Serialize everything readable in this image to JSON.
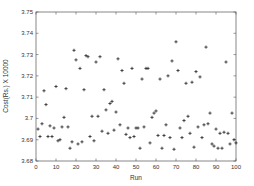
{
  "chart_data": {
    "type": "scatter",
    "title": "",
    "xlabel": "Run",
    "ylabel": "Cost(Rs.) X 10000",
    "xlim": [
      0,
      100
    ],
    "ylim": [
      3.68,
      3.75
    ],
    "xticks": [
      0,
      10,
      20,
      30,
      40,
      50,
      60,
      70,
      80,
      90,
      100
    ],
    "yticks": [
      3.68,
      3.69,
      3.7,
      3.71,
      3.72,
      3.73,
      3.74,
      3.75
    ],
    "ytick_labels": [
      "3.68",
      "3.69",
      "3.7",
      "3.71",
      "3.72",
      "3.73",
      "3.74",
      "3.75"
    ],
    "grid": false,
    "legend": null,
    "marker": "+",
    "marker_color": "#222222",
    "series": [
      {
        "name": "cost",
        "x": [
          1,
          2,
          3,
          4,
          5,
          6,
          7,
          8,
          9,
          10,
          11,
          12,
          13,
          14,
          15,
          16,
          17,
          18,
          19,
          20,
          21,
          22,
          23,
          24,
          25,
          26,
          27,
          28,
          29,
          30,
          31,
          32,
          33,
          34,
          35,
          36,
          37,
          38,
          39,
          40,
          41,
          42,
          43,
          44,
          45,
          46,
          47,
          48,
          49,
          50,
          51,
          52,
          53,
          54,
          55,
          56,
          57,
          58,
          59,
          60,
          61,
          62,
          63,
          64,
          65,
          66,
          67,
          68,
          69,
          70,
          71,
          72,
          73,
          74,
          75,
          76,
          77,
          78,
          79,
          80,
          81,
          82,
          83,
          84,
          85,
          86,
          87,
          88,
          89,
          90,
          91,
          92,
          93,
          94,
          95,
          96,
          97,
          98,
          99,
          100
        ],
        "y": [
          3.695,
          3.6915,
          3.6975,
          3.713,
          3.7065,
          3.6915,
          3.6965,
          3.6915,
          3.6955,
          3.715,
          3.6895,
          3.69,
          3.696,
          3.7005,
          3.714,
          3.696,
          3.686,
          3.689,
          3.732,
          3.7275,
          3.688,
          3.7235,
          3.689,
          3.7135,
          3.7295,
          3.729,
          3.6915,
          3.701,
          3.6895,
          3.7265,
          3.701,
          3.729,
          3.694,
          3.7135,
          3.704,
          3.693,
          3.707,
          3.708,
          3.6945,
          3.703,
          3.728,
          3.697,
          3.7225,
          3.7165,
          3.6925,
          3.6955,
          3.691,
          3.7235,
          3.6915,
          3.6955,
          3.6955,
          3.686,
          3.7185,
          3.696,
          3.7235,
          3.7235,
          3.6885,
          3.7005,
          3.7025,
          3.7035,
          3.692,
          3.7185,
          3.686,
          3.692,
          3.697,
          3.72,
          3.691,
          3.727,
          3.6855,
          3.736,
          3.7225,
          3.6955,
          3.691,
          3.699,
          3.7165,
          3.701,
          3.693,
          3.717,
          3.6865,
          3.722,
          3.696,
          3.7195,
          3.691,
          3.697,
          3.7335,
          3.6975,
          3.7025,
          3.688,
          3.687,
          3.695,
          3.686,
          3.693,
          3.686,
          3.6935,
          3.7265,
          3.693,
          3.688,
          3.7025,
          3.69,
          3.6885
        ]
      }
    ]
  }
}
